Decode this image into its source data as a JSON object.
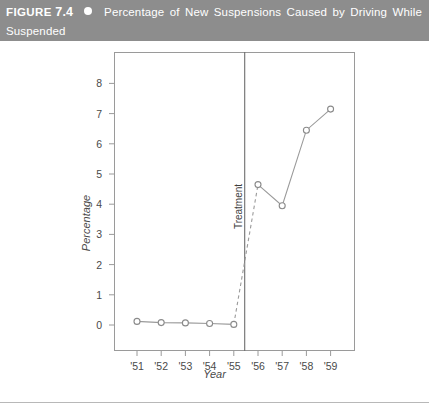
{
  "header": {
    "figure_label": "FIGURE",
    "figure_number": "7.4",
    "bullet_icon": "filled-circle-icon",
    "title_line1": "Percentage of New Suspensions Caused by Driving While",
    "title_line2": "Suspended",
    "background_color": "#8d8d8d",
    "text_color": "#ffffff"
  },
  "chart_data": {
    "type": "line",
    "title": "Percentage of New Suspensions Caused by Driving While Suspended",
    "xlabel": "Year",
    "ylabel": "Percentage",
    "categories": [
      "'51",
      "'52",
      "'53",
      "'54",
      "'55",
      "'56",
      "'57",
      "'58",
      "'59"
    ],
    "x": [
      51,
      52,
      53,
      54,
      55,
      56,
      57,
      58,
      59
    ],
    "values": [
      0.12,
      0.08,
      0.07,
      0.05,
      0.02,
      4.65,
      3.95,
      6.45,
      7.15
    ],
    "series": [
      {
        "name": "Percentage of new suspensions",
        "values": [
          0.12,
          0.08,
          0.07,
          0.05,
          0.02,
          4.65,
          3.95,
          6.45,
          7.15
        ],
        "marker": "open-circle",
        "line_color": "#8a8a8a",
        "segment_styles": [
          "solid",
          "solid",
          "solid",
          "solid",
          "dashed",
          "solid",
          "solid",
          "solid"
        ]
      }
    ],
    "ylim": [
      0,
      8.6
    ],
    "yticks": [
      0,
      1,
      2,
      3,
      4,
      5,
      6,
      7,
      8
    ],
    "ytick_labels": [
      "0",
      "1",
      "2",
      "3",
      "4",
      "5",
      "6",
      "7",
      "8"
    ],
    "xtick_labels": [
      "'51",
      "'52",
      "'53",
      "'54",
      "'55",
      "'56",
      "'57",
      "'58",
      "'59"
    ],
    "grid": false,
    "legend": "none",
    "annotations": [
      {
        "name": "treatment-line",
        "label": "Treatment",
        "type": "vertical-line",
        "x_position": 55.45,
        "orientation": "vertical",
        "style": "solid"
      }
    ],
    "interruption": {
      "label": "Treatment",
      "before_mean": 0.07,
      "after_mean": 5.55
    }
  },
  "axis": {
    "y_label": "Percentage",
    "x_label": "Year",
    "treatment_label": "Treatment"
  }
}
